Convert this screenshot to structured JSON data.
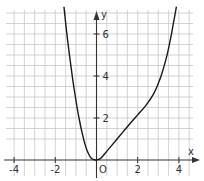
{
  "chart_data": {
    "type": "line",
    "title": "",
    "xlabel": "x",
    "ylabel": "y",
    "origin_label": "O",
    "xlim": [
      -4.4,
      4.5
    ],
    "ylim": [
      0,
      7.3
    ],
    "grid": true,
    "grid_step": 0.5,
    "x_ticks": [
      -4,
      -2,
      2,
      4
    ],
    "x_tick_labels": [
      "-4",
      "-2",
      "2",
      "4"
    ],
    "y_ticks": [
      2,
      4,
      6
    ],
    "y_tick_labels": [
      "2",
      "4",
      "6"
    ],
    "series": [
      {
        "name": "f",
        "x": [
          -1.58,
          -1.45,
          -1.3,
          -1.15,
          -1.0,
          -0.85,
          -0.7,
          -0.55,
          -0.4,
          -0.25,
          -0.1,
          0.0
        ],
        "y": [
          7.3,
          6.1,
          4.9,
          3.8,
          2.85,
          2.0,
          1.3,
          0.72,
          0.32,
          0.08,
          0.01,
          0.0
        ]
      },
      {
        "name": "f-right",
        "x": [
          0.0,
          0.2,
          0.4,
          0.7,
          1.0,
          1.3,
          1.6,
          2.0,
          2.4,
          2.8,
          3.1,
          3.4,
          3.6,
          3.75,
          3.88
        ],
        "y": [
          0.0,
          0.08,
          0.3,
          0.65,
          1.0,
          1.35,
          1.7,
          2.15,
          2.6,
          3.2,
          3.9,
          4.9,
          5.8,
          6.6,
          7.3
        ]
      }
    ]
  }
}
